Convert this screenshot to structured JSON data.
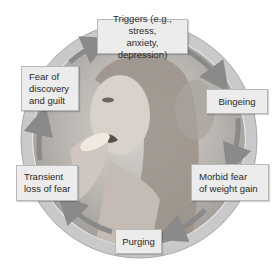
{
  "diagram": {
    "type": "cycle",
    "center_image": "grayscale photo of a young woman eating food",
    "colors": {
      "ring": "#bdbdbd",
      "arrow": "#8a8a8a",
      "box_fill": "#ececec",
      "box_border": "#b8b8b8",
      "text": "#2a2a2a"
    },
    "nodes": [
      {
        "id": "triggers",
        "label": "Triggers (e.g., stress,\nanxiety, depression)"
      },
      {
        "id": "bingeing",
        "label": "Bingeing"
      },
      {
        "id": "morbid",
        "label": "Morbid fear\nof weight gain"
      },
      {
        "id": "purging",
        "label": "Purging"
      },
      {
        "id": "transient",
        "label": "Transient\nloss of fear"
      },
      {
        "id": "fear",
        "label": "Fear of\ndiscovery\nand guilt"
      }
    ],
    "edges": [
      {
        "from": "triggers",
        "to": "bingeing"
      },
      {
        "from": "bingeing",
        "to": "morbid"
      },
      {
        "from": "morbid",
        "to": "purging"
      },
      {
        "from": "purging",
        "to": "transient"
      },
      {
        "from": "transient",
        "to": "fear"
      },
      {
        "from": "fear",
        "to": "triggers"
      }
    ]
  }
}
